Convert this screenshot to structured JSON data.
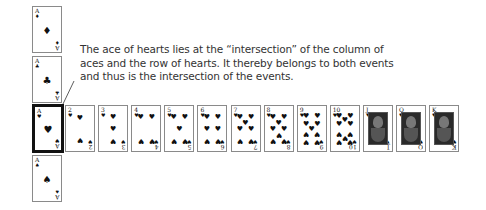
{
  "caption": {
    "text": "The ace of hearts lies at the “intersection” of the column of aces and the row of hearts. It thereby belongs to both events and thus is the intersection of the events."
  },
  "colors": {
    "card_border": "#8a8a8a",
    "highlight_border": "#111111",
    "ink": "#111111",
    "text": "#333333"
  },
  "column_of_aces": [
    {
      "rank": "A",
      "suit": "♦",
      "suit_name": "diamonds"
    },
    {
      "rank": "A",
      "suit": "♣",
      "suit_name": "clubs"
    },
    {
      "rank": "A",
      "suit": "♥",
      "suit_name": "hearts",
      "highlighted": true
    },
    {
      "rank": "A",
      "suit": "♠",
      "suit_name": "spades"
    }
  ],
  "row_of_hearts": [
    {
      "rank": "2",
      "suit": "♥"
    },
    {
      "rank": "3",
      "suit": "♥"
    },
    {
      "rank": "4",
      "suit": "♥"
    },
    {
      "rank": "5",
      "suit": "♥"
    },
    {
      "rank": "6",
      "suit": "♥"
    },
    {
      "rank": "7",
      "suit": "♥"
    },
    {
      "rank": "8",
      "suit": "♥"
    },
    {
      "rank": "9",
      "suit": "♥"
    },
    {
      "rank": "10",
      "suit": "♥"
    },
    {
      "rank": "J",
      "suit": "♥",
      "face": true
    },
    {
      "rank": "Q",
      "suit": "♥",
      "face": true
    },
    {
      "rank": "K",
      "suit": "♥",
      "face": true
    }
  ]
}
